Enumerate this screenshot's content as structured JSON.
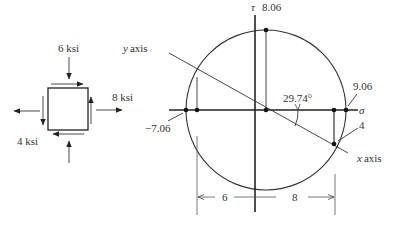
{
  "element": {
    "labels": {
      "top": "6 ksi",
      "right": "8 ksi",
      "bottom_left": "4 ksi"
    },
    "stresses": {
      "sigma_x": 8,
      "sigma_y": -6,
      "tau_xy": 4,
      "units": "ksi"
    }
  },
  "mohr": {
    "center_sigma": 1,
    "radius": 8.06,
    "tau_axis_label": "τ",
    "sigma_axis_label": "σ",
    "tau_max_label": "8.06",
    "sigma_max_label": "9.06",
    "sigma_min_label": "−7.06",
    "angle_label": "29.74°",
    "x_point": {
      "sigma": 8,
      "tau": 4,
      "label": "4"
    },
    "y_point": {
      "sigma": -6,
      "tau": -4
    },
    "x_axis_label": "x axis",
    "y_axis_label": "y axis",
    "dim_left_label": "6",
    "dim_right_label": "8"
  }
}
